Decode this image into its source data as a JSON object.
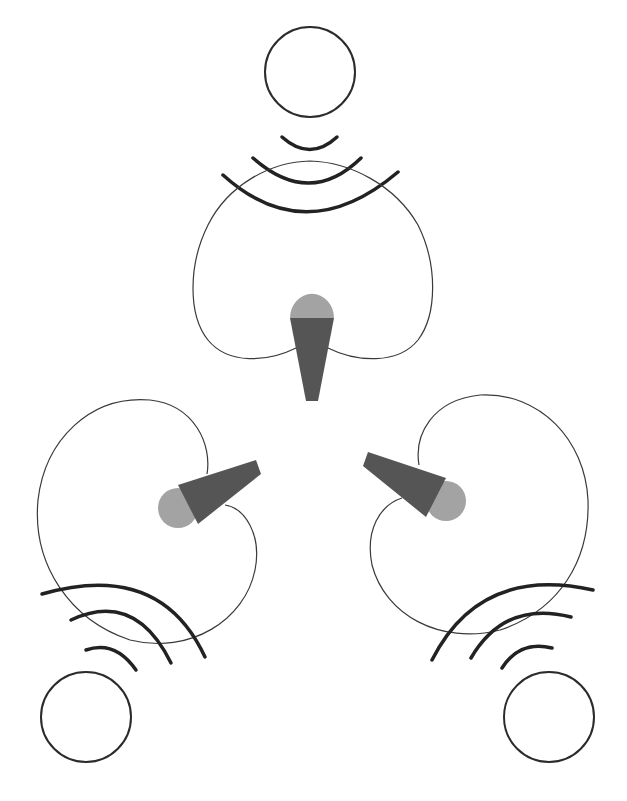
{
  "diagram": {
    "colors": {
      "background": "#ffffff",
      "outline": "#2b2b2b",
      "mic_head": "#a3a3a3",
      "mic_body": "#555555"
    },
    "nodes": [
      {
        "id": "source-top",
        "kind": "sound-source-circle",
        "center": [
          310,
          72
        ],
        "radius": 45
      },
      {
        "id": "mic-top",
        "kind": "microphone",
        "orientation": "pointing-up",
        "pickup_pattern": "cardioid"
      },
      {
        "id": "source-bottom-left",
        "kind": "sound-source-circle",
        "center": [
          86,
          717
        ],
        "radius": 45
      },
      {
        "id": "mic-left",
        "kind": "microphone",
        "orientation": "pointing-down-left",
        "pickup_pattern": "cardioid"
      },
      {
        "id": "source-bottom-right",
        "kind": "sound-source-circle",
        "center": [
          549,
          717
        ],
        "radius": 45
      },
      {
        "id": "mic-right",
        "kind": "microphone",
        "orientation": "pointing-down-right",
        "pickup_pattern": "cardioid"
      }
    ],
    "wave_arcs_per_source": 3
  }
}
